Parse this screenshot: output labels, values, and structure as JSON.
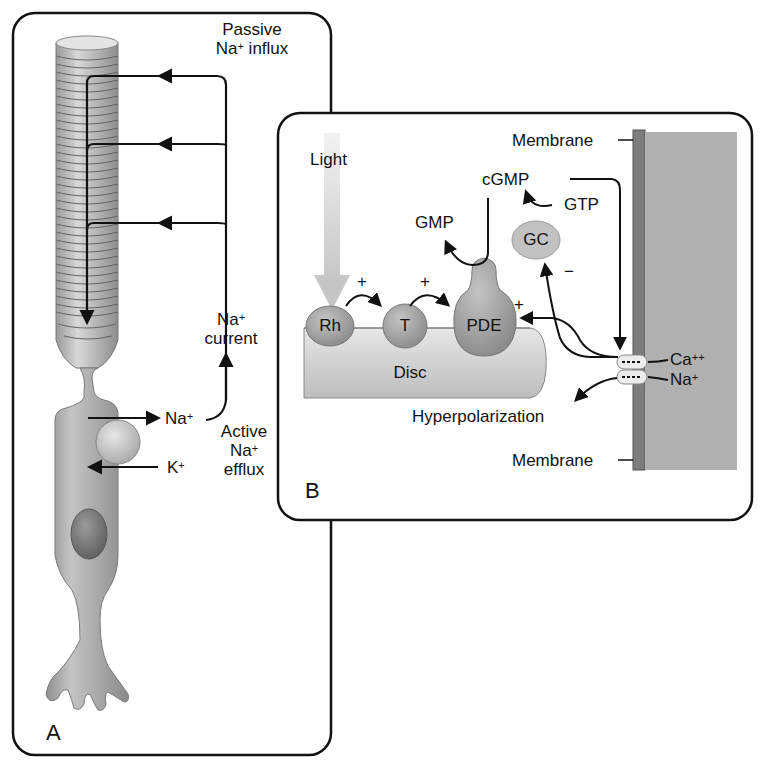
{
  "panel_a": {
    "letter": "A",
    "labels": {
      "passive_line1": "Passive",
      "passive_line2_base": "Na",
      "passive_line2_sup": "+",
      "passive_line2_rest": " influx",
      "current_base": "Na",
      "current_sup": "+",
      "current_line2": "current",
      "na_base": "Na",
      "na_sup": "+",
      "k_base": "K",
      "k_sup": "+",
      "active_line1": "Active",
      "active_line2_base": "Na",
      "active_line2_sup": "+",
      "active_line3": "efflux"
    }
  },
  "panel_b": {
    "letter": "B",
    "labels": {
      "light": "Light",
      "membrane_top": "Membrane",
      "membrane_bottom": "Membrane",
      "cgmp": "cGMP",
      "gmp": "GMP",
      "gtp": "GTP",
      "gc": "GC",
      "rh": "Rh",
      "t": "T",
      "pde": "PDE",
      "disc": "Disc",
      "plus1": "+",
      "plus2": "+",
      "plus3": "+",
      "minus": "−",
      "ca_base": "Ca",
      "ca_sup": "++",
      "na_base": "Na",
      "na_sup": "+",
      "hyperpolarization": "Hyperpolarization"
    }
  },
  "colors": {
    "cell_fill": "#a8a8a8",
    "membrane_dark": "#7a7a7a",
    "membrane_light": "#b4b4b4",
    "disc_fill": "#d2d2d2",
    "protein_fill": "#9c9c9c",
    "outline": "#111111"
  }
}
